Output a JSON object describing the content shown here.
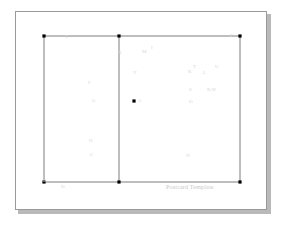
{
  "document": {
    "caption": "Postcard Template",
    "caption_position": {
      "x": 150,
      "y": 172
    }
  },
  "style": {
    "sheet_background": "#ffffff",
    "sheet_border": "#9a9a9a",
    "shadow_color": "#b9b9b9",
    "line_color": "#6e6e6e",
    "vertex_color": "#000000",
    "label_color": "#d6d6d6",
    "caption_color": "#c6c6c6"
  },
  "geometry": {
    "outline": {
      "left": 28,
      "top": 24,
      "right": 224,
      "bottom": 170
    },
    "divider_x": 103,
    "vertices": [
      {
        "name": "top-left-vertex",
        "x": 28,
        "y": 24
      },
      {
        "name": "top-middle-vertex",
        "x": 103,
        "y": 24
      },
      {
        "name": "top-right-vertex",
        "x": 224,
        "y": 24
      },
      {
        "name": "bottom-left-vertex",
        "x": 28,
        "y": 170
      },
      {
        "name": "bottom-middle-vertex",
        "x": 103,
        "y": 170
      },
      {
        "name": "bottom-right-vertex",
        "x": 224,
        "y": 170
      },
      {
        "name": "interior-point-vertex",
        "x": 118,
        "y": 89
      }
    ]
  },
  "points": [
    {
      "id": "E",
      "label": "E",
      "x": 49,
      "y": 22
    },
    {
      "id": "P",
      "label": "P",
      "x": 214,
      "y": 21
    },
    {
      "id": "X",
      "label": "X",
      "x": 102,
      "y": 38
    },
    {
      "id": "M",
      "label": "M",
      "x": 126,
      "y": 37
    },
    {
      "id": "I",
      "label": "I",
      "x": 135,
      "y": 33
    },
    {
      "id": "Y",
      "label": "Y",
      "x": 117,
      "y": 58
    },
    {
      "id": "K",
      "label": "K",
      "x": 172,
      "y": 57
    },
    {
      "id": "T",
      "label": "T",
      "x": 177,
      "y": 52
    },
    {
      "id": "L",
      "label": "L",
      "x": 187,
      "y": 58
    },
    {
      "id": "U",
      "label": "U",
      "x": 199,
      "y": 52
    },
    {
      "id": "F",
      "label": "F",
      "x": 72,
      "y": 68
    },
    {
      "id": "S",
      "label": "S",
      "x": 173,
      "y": 75
    },
    {
      "id": "RW",
      "label": "R,W",
      "x": 191,
      "y": 75
    },
    {
      "id": "G",
      "label": "G",
      "x": 76,
      "y": 86
    },
    {
      "id": "A",
      "label": "A",
      "x": 122,
      "y": 86
    },
    {
      "id": "O",
      "label": "O",
      "x": 173,
      "y": 87
    },
    {
      "id": "H",
      "label": "H",
      "x": 73,
      "y": 126
    },
    {
      "id": "C",
      "label": "C",
      "x": 74,
      "y": 140
    },
    {
      "id": "N",
      "label": "N",
      "x": 170,
      "y": 141
    },
    {
      "id": "B",
      "label": "B",
      "x": 27,
      "y": 166
    },
    {
      "id": "D",
      "label": "D",
      "x": 45,
      "y": 172
    }
  ]
}
